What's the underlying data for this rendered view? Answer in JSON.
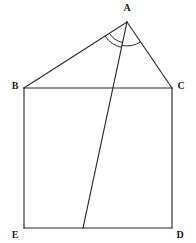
{
  "figure": {
    "background_color": "#ffffff",
    "stroke_color": "#2b2b2b",
    "label_color": "#1a1a1a",
    "points": {
      "A": {
        "label": "A",
        "x": 127,
        "y": 22,
        "label_x": 127,
        "label_y": 9
      },
      "B": {
        "label": "B",
        "x": 24,
        "y": 88,
        "label_x": 15,
        "label_y": 87
      },
      "C": {
        "label": "C",
        "x": 172,
        "y": 88,
        "label_x": 181,
        "label_y": 87
      },
      "D": {
        "label": "D",
        "x": 172,
        "y": 228,
        "label_x": 180,
        "label_y": 236
      },
      "E": {
        "label": "E",
        "x": 24,
        "y": 228,
        "label_x": 15,
        "label_y": 236
      },
      "F": {
        "label": "",
        "x": 83,
        "y": 228,
        "label_x": 83,
        "label_y": 228
      }
    },
    "segments": [
      {
        "name": "segment-AB",
        "from": "A",
        "to": "B"
      },
      {
        "name": "segment-AC",
        "from": "A",
        "to": "C"
      },
      {
        "name": "segment-BC",
        "from": "B",
        "to": "C"
      },
      {
        "name": "segment-BE",
        "from": "B",
        "to": "E"
      },
      {
        "name": "segment-CD",
        "from": "C",
        "to": "D"
      },
      {
        "name": "segment-ED",
        "from": "E",
        "to": "D"
      },
      {
        "name": "segment-AF-cevian",
        "from": "A",
        "to": "F"
      }
    ],
    "angle_arcs": [
      {
        "name": "angle-arc-BAF-outer",
        "radius": 26
      },
      {
        "name": "angle-arc-BAF-inner",
        "radius": 21
      },
      {
        "name": "angle-arc-FAC",
        "radius": 24
      }
    ]
  }
}
